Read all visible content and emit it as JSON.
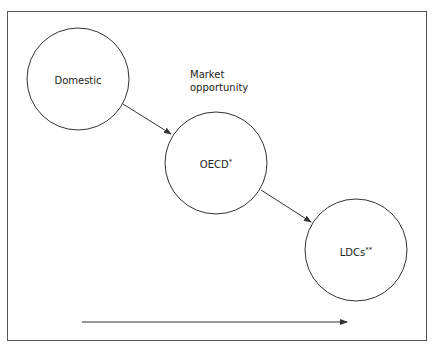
{
  "diagram": {
    "nodes": [
      {
        "id": "domestic",
        "label": "Domestic",
        "sup": ""
      },
      {
        "id": "oecd",
        "label": "OECD",
        "sup": "*"
      },
      {
        "id": "ldcs",
        "label": "LDCs",
        "sup": "**"
      }
    ],
    "annotation": {
      "line1": "Market",
      "line2": "opportunity"
    },
    "edges": [
      {
        "from": "domestic",
        "to": "oecd"
      },
      {
        "from": "oecd",
        "to": "ldcs"
      }
    ],
    "axis_arrow": "horizontal arrow (left to right)",
    "colors": {
      "stroke": "#333333",
      "border": "#555555"
    }
  }
}
